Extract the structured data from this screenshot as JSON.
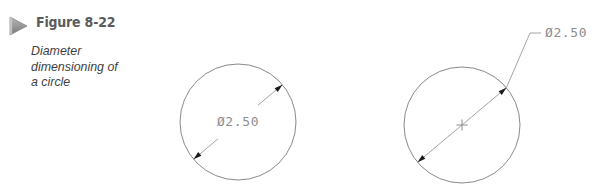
{
  "figure": {
    "marker_icon": "triangle-play-marker",
    "label": "Figure 8-22",
    "caption_line_1": "Diameter",
    "caption_line_2": "dimensioning of",
    "caption_line_3": "a circle",
    "caption_full": "Diameter dimensioning of a circle"
  },
  "colors": {
    "background": "#ffffff",
    "title_text": "#5b5b5b",
    "caption_text": "#3f3f3f",
    "marker_fill": "#9a9a9a",
    "marker_fill_dark": "#6e6e6e",
    "circle_stroke": "#8a8a8a",
    "dimension_line": "#9a9a9a",
    "dimension_text": "#8d8d8d",
    "arrowhead_fill": "#1a1a1a",
    "center_mark": "#7d7d7d"
  },
  "drawings": [
    {
      "id": "left-circle-internal-dimension",
      "name": "circle-with-internal-diameter-dimension",
      "circle": {
        "cx": 238,
        "cy": 122,
        "r": 58
      },
      "dimension_value": "Ø2.50",
      "dimension_placement": "inside",
      "dimension_text_x": 238,
      "dimension_text_y": 126,
      "dimension_angle_deg": 40,
      "has_center_mark": false,
      "arrowheads": 2
    },
    {
      "id": "right-circle-external-leader",
      "name": "circle-with-external-leader-diameter-dimension",
      "circle": {
        "cx": 462,
        "cy": 125,
        "r": 58
      },
      "dimension_value": "Ø2.50",
      "dimension_placement": "outside",
      "dimension_text_x": 545,
      "dimension_text_y": 37,
      "leader_bend_x": 530,
      "leader_bend_y": 33,
      "dimension_angle_deg": 40,
      "has_center_mark": true,
      "arrowheads": 2
    }
  ]
}
